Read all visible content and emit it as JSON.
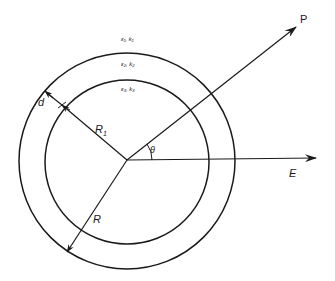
{
  "diagram": {
    "type": "concentric-shell-geometry",
    "labels": {
      "region_outer": "ε₁, k₁",
      "region_shell": "ε₂, k₂",
      "region_inner": "ε₃, k₃",
      "thickness": "d",
      "inner_radius": "R",
      "inner_radius_sub": "1",
      "outer_radius": "R",
      "angle": "θ",
      "point": "P",
      "field": "E"
    },
    "colors": {
      "stroke": "#1a1a1a",
      "background": "#ffffff"
    },
    "geometry": {
      "center": [
        127,
        160
      ],
      "outer_radius_px": 108,
      "inner_radius_px": 82
    }
  }
}
